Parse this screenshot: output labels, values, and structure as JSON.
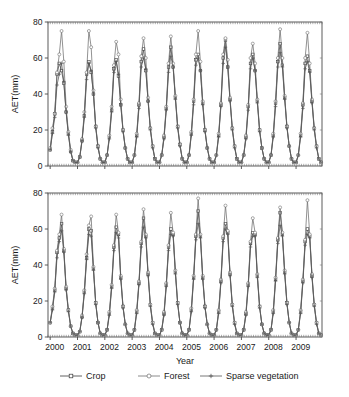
{
  "figure": {
    "background": "#ffffff",
    "axis_color": "#4a4a4a",
    "text_color": "#1a1a1a"
  },
  "axes": {
    "y_label": "AET(mm)",
    "x_label": "Year",
    "y_ticks": [
      "0",
      "20",
      "40",
      "60",
      "80"
    ],
    "x_ticks": [
      "2000",
      "2001",
      "2002",
      "2003",
      "2004",
      "2005",
      "2006",
      "2007",
      "2008",
      "2009"
    ]
  },
  "legend": {
    "position": "bottom-center",
    "items": [
      {
        "label": "Crop",
        "marker": "square-open",
        "color": "#3a3a3a"
      },
      {
        "label": "Forest",
        "marker": "circle-open",
        "color": "#6e6e6e"
      },
      {
        "label": "Sparse vegetation",
        "marker": "star",
        "color": "#555555"
      }
    ]
  },
  "chart_data": {
    "type": "line",
    "title": "",
    "xlabel": "Year",
    "ylabel": "AET(mm)",
    "xlim": [
      1999.92,
      2009.95
    ],
    "ylim": [
      0,
      80
    ],
    "grid": false,
    "legend_position": "bottom",
    "panels": [
      {
        "panel_id": "top",
        "ylabel": "AET(mm)",
        "ylim": [
          0,
          80
        ],
        "yticks": [
          0,
          20,
          40,
          60,
          80
        ],
        "xticks": [
          2000,
          2001,
          2002,
          2003,
          2004,
          2005,
          2006,
          2007,
          2008,
          2009
        ],
        "x_step_months": 1,
        "x_start": 2000.0,
        "series": [
          {
            "name": "Crop",
            "marker": "square-open",
            "color": "#3a3a3a",
            "values": [
              9,
              19,
              29,
              51,
              57,
              53,
              46,
              30,
              18,
              8,
              3,
              2,
              2,
              5,
              14,
              28,
              51,
              58,
              52,
              40,
              22,
              11,
              4,
              2,
              2,
              6,
              16,
              31,
              54,
              59,
              50,
              34,
              20,
              10,
              4,
              2,
              2,
              6,
              17,
              34,
              58,
              65,
              53,
              36,
              21,
              11,
              4,
              2,
              2,
              6,
              16,
              32,
              55,
              66,
              55,
              38,
              22,
              12,
              4,
              2,
              2,
              6,
              18,
              36,
              59,
              62,
              53,
              35,
              20,
              10,
              4,
              2,
              2,
              6,
              17,
              34,
              60,
              70,
              55,
              37,
              21,
              11,
              4,
              2,
              2,
              6,
              16,
              33,
              57,
              62,
              53,
              36,
              20,
              10,
              4,
              2,
              2,
              6,
              17,
              35,
              58,
              68,
              56,
              38,
              22,
              11,
              4,
              2,
              2,
              6,
              17,
              34,
              57,
              61,
              53,
              36,
              21,
              11,
              4,
              2
            ]
          },
          {
            "name": "Forest",
            "marker": "circle-open",
            "color": "#6e6e6e",
            "values": [
              10,
              21,
              29,
              52,
              62,
              75,
              58,
              33,
              19,
              9,
              3,
              2,
              2,
              5,
              15,
              30,
              52,
              75,
              66,
              42,
              22,
              11,
              4,
              2,
              2,
              6,
              17,
              33,
              56,
              69,
              62,
              37,
              20,
              10,
              4,
              2,
              2,
              6,
              18,
              35,
              61,
              71,
              60,
              38,
              21,
              11,
              4,
              2,
              2,
              6,
              17,
              33,
              57,
              72,
              57,
              39,
              22,
              12,
              4,
              2,
              2,
              6,
              19,
              37,
              62,
              75,
              58,
              36,
              20,
              10,
              4,
              2,
              2,
              6,
              18,
              35,
              62,
              71,
              59,
              38,
              21,
              11,
              4,
              2,
              2,
              6,
              17,
              34,
              60,
              68,
              57,
              37,
              20,
              10,
              4,
              2,
              2,
              6,
              18,
              36,
              60,
              76,
              60,
              39,
              22,
              11,
              4,
              2,
              2,
              6,
              18,
              35,
              60,
              74,
              57,
              37,
              21,
              11,
              4,
              2
            ]
          },
          {
            "name": "Sparse vegetation",
            "marker": "star",
            "color": "#555555",
            "values": [
              9,
              18,
              27,
              45,
              51,
              57,
              47,
              30,
              17,
              8,
              3,
              2,
              2,
              5,
              14,
              27,
              48,
              57,
              53,
              40,
              21,
              10,
              4,
              2,
              2,
              6,
              15,
              30,
              52,
              58,
              51,
              34,
              19,
              10,
              4,
              2,
              2,
              6,
              16,
              32,
              55,
              60,
              54,
              36,
              20,
              10,
              4,
              2,
              2,
              6,
              15,
              31,
              52,
              61,
              55,
              37,
              21,
              11,
              4,
              2,
              2,
              6,
              17,
              34,
              56,
              60,
              53,
              34,
              19,
              10,
              4,
              2,
              2,
              6,
              16,
              33,
              57,
              66,
              55,
              36,
              20,
              10,
              4,
              2,
              2,
              6,
              15,
              31,
              54,
              60,
              53,
              35,
              19,
              10,
              4,
              2,
              2,
              6,
              16,
              33,
              55,
              63,
              55,
              37,
              21,
              11,
              4,
              2,
              2,
              6,
              16,
              32,
              54,
              58,
              52,
              35,
              20,
              10,
              4,
              2
            ]
          }
        ]
      },
      {
        "panel_id": "bottom",
        "ylabel": "AET(mm)",
        "ylim": [
          0,
          80
        ],
        "yticks": [
          0,
          20,
          40,
          60,
          80
        ],
        "xticks": [
          2000,
          2001,
          2002,
          2003,
          2004,
          2005,
          2006,
          2007,
          2008,
          2009
        ],
        "x_step_months": 1,
        "x_start": 2000.0,
        "series": [
          {
            "name": "Crop",
            "marker": "square-open",
            "color": "#3a3a3a",
            "values": [
              8,
              16,
              26,
              47,
              55,
              63,
              48,
              27,
              15,
              6,
              2,
              1,
              1,
              3,
              11,
              25,
              44,
              60,
              59,
              38,
              19,
              8,
              2,
              1,
              1,
              4,
              13,
              28,
              50,
              61,
              57,
              33,
              17,
              7,
              2,
              1,
              1,
              4,
              14,
              30,
              52,
              66,
              56,
              35,
              18,
              8,
              2,
              1,
              1,
              4,
              13,
              29,
              50,
              60,
              57,
              36,
              19,
              8,
              2,
              1,
              1,
              4,
              15,
              33,
              56,
              70,
              56,
              33,
              17,
              7,
              2,
              1,
              1,
              4,
              14,
              31,
              55,
              63,
              58,
              35,
              18,
              8,
              2,
              1,
              1,
              4,
              13,
              29,
              52,
              58,
              57,
              34,
              17,
              7,
              2,
              1,
              1,
              4,
              14,
              32,
              54,
              69,
              57,
              36,
              19,
              8,
              2,
              1,
              1,
              4,
              14,
              31,
              53,
              60,
              56,
              34,
              18,
              8,
              2,
              1
            ]
          },
          {
            "name": "Forest",
            "marker": "circle-open",
            "color": "#6e6e6e",
            "values": [
              8,
              17,
              27,
              48,
              57,
              68,
              49,
              28,
              15,
              6,
              2,
              1,
              1,
              3,
              12,
              26,
              46,
              62,
              67,
              39,
              19,
              8,
              2,
              1,
              1,
              4,
              14,
              29,
              51,
              68,
              58,
              34,
              17,
              7,
              2,
              1,
              1,
              4,
              15,
              31,
              53,
              71,
              57,
              36,
              18,
              8,
              2,
              1,
              1,
              4,
              14,
              30,
              51,
              69,
              58,
              37,
              19,
              8,
              2,
              1,
              1,
              4,
              16,
              34,
              57,
              77,
              57,
              34,
              17,
              7,
              2,
              1,
              1,
              4,
              15,
              32,
              56,
              73,
              59,
              36,
              18,
              8,
              2,
              1,
              1,
              4,
              14,
              30,
              53,
              66,
              58,
              35,
              17,
              7,
              2,
              1,
              1,
              4,
              15,
              33,
              55,
              72,
              58,
              37,
              19,
              8,
              2,
              1,
              1,
              4,
              15,
              32,
              54,
              76,
              57,
              35,
              18,
              8,
              2,
              1
            ]
          },
          {
            "name": "Sparse vegetation",
            "marker": "star",
            "color": "#555555",
            "values": [
              8,
              15,
              25,
              44,
              53,
              59,
              47,
              26,
              14,
              6,
              2,
              1,
              1,
              3,
              11,
              24,
              43,
              57,
              56,
              37,
              18,
              8,
              2,
              1,
              1,
              4,
              12,
              27,
              48,
              58,
              55,
              32,
              16,
              7,
              2,
              1,
              1,
              4,
              13,
              29,
              50,
              61,
              55,
              34,
              17,
              7,
              2,
              1,
              1,
              4,
              12,
              28,
              48,
              57,
              56,
              35,
              18,
              8,
              2,
              1,
              1,
              4,
              14,
              32,
              54,
              63,
              55,
              32,
              16,
              7,
              2,
              1,
              1,
              4,
              13,
              30,
              53,
              60,
              57,
              34,
              17,
              7,
              2,
              1,
              1,
              4,
              12,
              28,
              50,
              56,
              56,
              33,
              16,
              7,
              2,
              1,
              1,
              4,
              13,
              31,
              52,
              62,
              56,
              35,
              18,
              8,
              2,
              1,
              1,
              4,
              13,
              30,
              51,
              57,
              55,
              33,
              17,
              7,
              2,
              1
            ]
          }
        ]
      }
    ]
  }
}
